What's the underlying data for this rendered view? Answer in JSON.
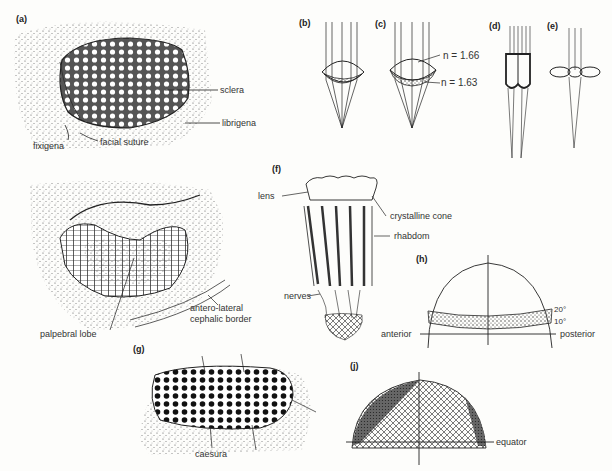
{
  "figure": {
    "panels": {
      "a": {
        "label": "(a)",
        "annotations": [
          "sclera",
          "librigena",
          "fixigena",
          "facial suture"
        ]
      },
      "a2": {
        "annotations": [
          "palpebral lobe",
          "antero-lateral",
          "cephalic border"
        ]
      },
      "b": {
        "label": "(b)"
      },
      "c": {
        "label": "(c)",
        "annotations": [
          "n = 1.66",
          "n = 1.63"
        ]
      },
      "d": {
        "label": "(d)"
      },
      "e": {
        "label": "(e)"
      },
      "f": {
        "label": "(f)",
        "annotations": [
          "lens",
          "crystalline cone",
          "rhabdom",
          "nerves"
        ]
      },
      "g": {
        "label": "(g)",
        "annotations": [
          "caesura"
        ]
      },
      "h": {
        "label": "(h)",
        "annotations": [
          "20°",
          "10°",
          "anterior",
          "posterior"
        ]
      },
      "j": {
        "label": "(j)",
        "annotations": [
          "equator"
        ]
      }
    }
  }
}
